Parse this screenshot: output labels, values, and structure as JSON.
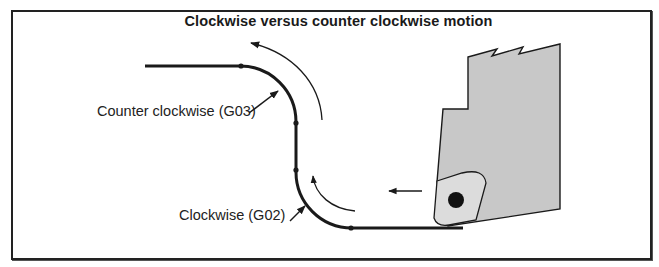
{
  "figure": {
    "cropped_caption_fragment": "Examples of clockwise and counter clockwise motion in turning",
    "title": "Clockwise versus counter clockwise motion",
    "labels": {
      "counter_clockwise": "Counter clockwise (G03)",
      "clockwise": "Clockwise (G02)"
    },
    "elements": {
      "toolpath": "tool-path-line",
      "ccw_direction_arrow": "counter-clockwise-direction-arrow",
      "cw_direction_arrow": "clockwise-direction-arrow",
      "feed_arrow": "feed-direction-arrow",
      "tool_holder": "tool-holder",
      "insert": "cutting-insert"
    },
    "colors": {
      "line": "#1a1a1a",
      "tool_holder_fill": "#c8c8c8",
      "insert_fill": "#dcdcdc",
      "insert_hole": "#111111",
      "frame": "#222222"
    }
  }
}
